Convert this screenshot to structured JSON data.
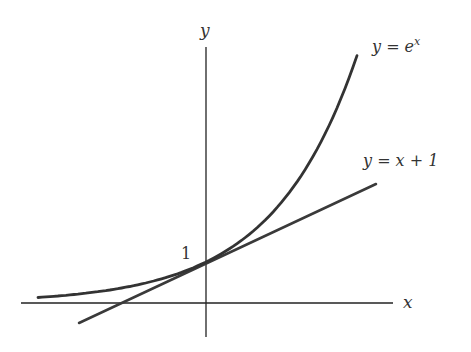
{
  "figure": {
    "axis_labels": {
      "x": "x",
      "y": "y"
    },
    "intercept_label": "1",
    "curves": [
      {
        "name": "exponential",
        "label": "y = e^x",
        "label_base": "y = e",
        "label_sup": "x"
      },
      {
        "name": "tangent-line",
        "label": "y = x + 1"
      }
    ],
    "colors": {
      "axes": "#222222",
      "curve": "#333333"
    }
  }
}
